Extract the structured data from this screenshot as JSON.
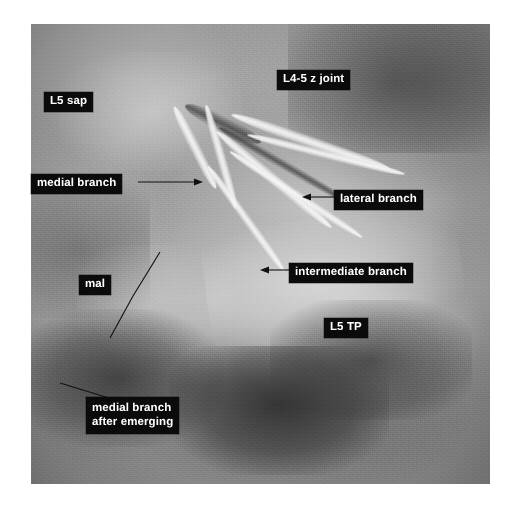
{
  "figure": {
    "kind": "anatomical-dissection-photograph",
    "photo": {
      "left": 31,
      "top": 24,
      "width": 459,
      "height": 460,
      "border_color": "#ffffff",
      "background_color": "#8e8e8e"
    },
    "label_style": {
      "background": "#0b0b0b",
      "text_color": "#ffffff"
    }
  },
  "labels": [
    {
      "id": "l4-5-z-joint",
      "text": "L4-5 z joint",
      "left": 277,
      "top": 70,
      "lines": 1,
      "has_leader": false
    },
    {
      "id": "l5-sap",
      "text": "L5 sap",
      "left": 44,
      "top": 92,
      "lines": 1,
      "has_leader": false
    },
    {
      "id": "medial-branch",
      "text": "medial branch",
      "left": 31,
      "top": 174,
      "lines": 1,
      "has_leader": true,
      "leader": "arrow pointing right to the medial branch filament"
    },
    {
      "id": "lateral-branch",
      "text": "lateral branch",
      "left": 334,
      "top": 190,
      "lines": 1,
      "has_leader": true,
      "leader": "arrow pointing left to the lateral branch filament"
    },
    {
      "id": "intermediate-branch",
      "text": "intermediate branch",
      "left": 289,
      "top": 263,
      "lines": 1,
      "has_leader": true,
      "leader": "arrow pointing left to the intermediate branch filament"
    },
    {
      "id": "mal",
      "text": "mal",
      "left": 79,
      "top": 275,
      "lines": 1,
      "has_leader": true,
      "leader": "plain diagonal line descending to the mamillo-accessory ligament"
    },
    {
      "id": "l5-tp",
      "text": "L5 TP",
      "left": 324,
      "top": 318,
      "lines": 1,
      "has_leader": false
    },
    {
      "id": "medial-branch-after-emerging",
      "text": "medial branch\nafter emerging",
      "line1": "medial branch",
      "line2": "after emerging",
      "left": 86,
      "top": 397,
      "lines": 2,
      "has_leader": true,
      "leader": "plain line ascending to the left toward the emerging medial branch"
    }
  ],
  "ghost_caption": {
    "text": "faint bleed-through of caption text",
    "legible": false
  }
}
